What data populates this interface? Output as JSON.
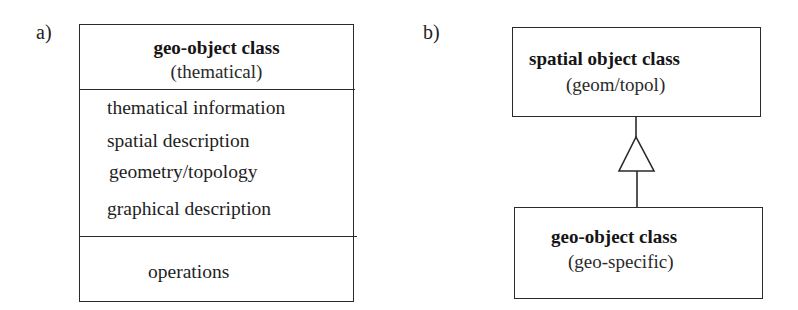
{
  "figure": {
    "panel_a": {
      "label": "a)",
      "class_box": {
        "name": "geo-object class",
        "stereotype": "(thematical)",
        "attributes": [
          "thematical  information",
          "spatial  description",
          "geometry/topology",
          "graphical description"
        ],
        "operations": "operations"
      }
    },
    "panel_b": {
      "label": "b)",
      "superclass": {
        "name": "spatial object class",
        "stereotype": "(geom/topol)"
      },
      "subclass": {
        "name": "geo-object class",
        "stereotype": "(geo-specific)"
      },
      "relationship": "generalization"
    },
    "colors": {
      "line": "#2a2a2a",
      "text": "#1e1e1e",
      "background": "#ffffff"
    }
  }
}
